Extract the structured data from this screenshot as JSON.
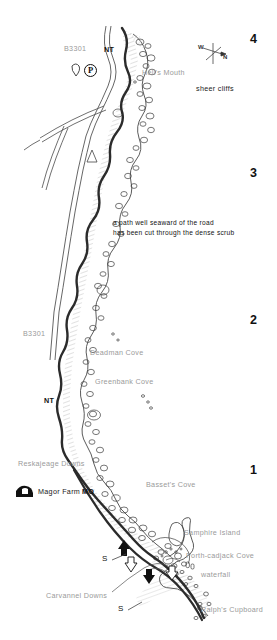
{
  "map": {
    "title": "Hell's Mouth to Ralph's Cupboard coast path",
    "note_line1": "a path well seaward of the road",
    "note_line2": "has been cut through the dense scrub",
    "annotation_sheer_cliffs": "sheer cliffs",
    "compass": {
      "north_letter": "N",
      "west_letter": "W"
    },
    "segment_numbers": [
      "4",
      "3",
      "2",
      "1"
    ],
    "roads": [
      {
        "label": "B3301"
      },
      {
        "label": "B3301"
      }
    ],
    "nt_markers": [
      "NT",
      "NT"
    ],
    "steep_markers": [
      "S",
      "S",
      "S"
    ],
    "parking_symbol": "P",
    "places": [
      {
        "name": "Hell's Mouth"
      },
      {
        "name": "Deadman Cove"
      },
      {
        "name": "Greenbank Cove"
      },
      {
        "name": "Reskajeage Downs"
      },
      {
        "name": "Magor Farm"
      },
      {
        "name": "MO"
      },
      {
        "name": "Basset's Cove"
      },
      {
        "name": "Samphire Island"
      },
      {
        "name": "Porth-cadjack Cove"
      },
      {
        "name": "waterfall"
      },
      {
        "name": "Carvannel Downs"
      },
      {
        "name": "Ralph's Cupboard"
      }
    ],
    "colors": {
      "coast_line": "#2b2b2b",
      "road_line": "#3a3a3a",
      "label_grey": "#9a9a9a",
      "label_dark": "#111111",
      "cliff_hatch": "#8d8d8d"
    }
  }
}
